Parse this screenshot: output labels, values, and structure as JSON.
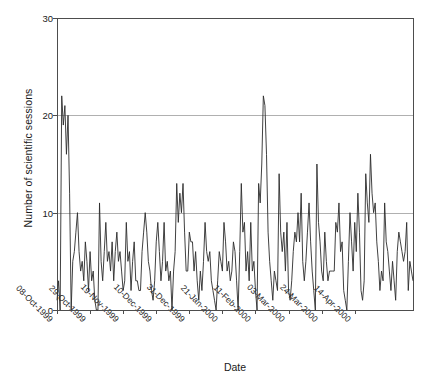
{
  "chart_data": {
    "type": "line",
    "title": "",
    "xlabel": "Date",
    "ylabel": "Number of scientific sessions",
    "ylim": [
      0,
      30
    ],
    "yticks": [
      0,
      10,
      20,
      30
    ],
    "grid": "horizontal",
    "legend": "none",
    "x_start": "08-Oct-1999",
    "x_end": "20-Apr-2000",
    "x_interval_days": 1,
    "xtick_labels": [
      "08-Oct-1999",
      "29-Oct-1999",
      "19-Nov-1999",
      "10-Dec-1999",
      "31-Dec-1999",
      "21-Jan-2000",
      "11-Feb-2000",
      "03-Mar-2000",
      "24-Mar-2000",
      "14-Apr-2000"
    ],
    "xtick_interval_days": 21,
    "series": [
      {
        "name": "Number of scientific sessions",
        "color": "#2b2b2b",
        "values": [
          1,
          3,
          0,
          22,
          19,
          21,
          16,
          20,
          12,
          0,
          5,
          6,
          8,
          10,
          6,
          4,
          5,
          3,
          7,
          5,
          2,
          6,
          3,
          4,
          1,
          0,
          0,
          11,
          5,
          3,
          6,
          9,
          5,
          6,
          4,
          7,
          3,
          6,
          8,
          5,
          6,
          4,
          2,
          3,
          9,
          5,
          6,
          2,
          5,
          7,
          3,
          3,
          2,
          2,
          6,
          8,
          10,
          8,
          5,
          4,
          2,
          1,
          3,
          7,
          9,
          6,
          3,
          5,
          9,
          4,
          5,
          3,
          4,
          0,
          4,
          6,
          13,
          9,
          12,
          10,
          13,
          8,
          4,
          4,
          8,
          7,
          7,
          4,
          6,
          3,
          1,
          4,
          2,
          5,
          9,
          6,
          5,
          6,
          3,
          2,
          1,
          0,
          3,
          6,
          5,
          4,
          9,
          7,
          4,
          5,
          3,
          4,
          7,
          6,
          3,
          0,
          6,
          13,
          8,
          9,
          4,
          6,
          3,
          9,
          4,
          5,
          2,
          0,
          13,
          11,
          15,
          22,
          21,
          16,
          8,
          5,
          3,
          1,
          4,
          3,
          2,
          14,
          8,
          6,
          8,
          4,
          9,
          2,
          1,
          3,
          6,
          8,
          7,
          10,
          7,
          12,
          5,
          3,
          5,
          8,
          11,
          7,
          4,
          2,
          0,
          15,
          9,
          7,
          4,
          3,
          8,
          5,
          3,
          4,
          4,
          4,
          4,
          9,
          8,
          11,
          6,
          7,
          2,
          1,
          0,
          5,
          10,
          7,
          4,
          9,
          6,
          12,
          8,
          2,
          1,
          3,
          14,
          11,
          9,
          16,
          12,
          10,
          11,
          7,
          5,
          2,
          4,
          3,
          11,
          7,
          6,
          4,
          2,
          5,
          3,
          1,
          6,
          8,
          7,
          6,
          5,
          6,
          9,
          2,
          5,
          4,
          3
        ]
      }
    ]
  },
  "figure": {
    "plot_left": 57,
    "plot_right": 413,
    "plot_top": 18,
    "plot_bottom": 310,
    "background": "#ffffff",
    "axis_color": "#4d4d4d",
    "grid_color": "#b0b0b0"
  }
}
